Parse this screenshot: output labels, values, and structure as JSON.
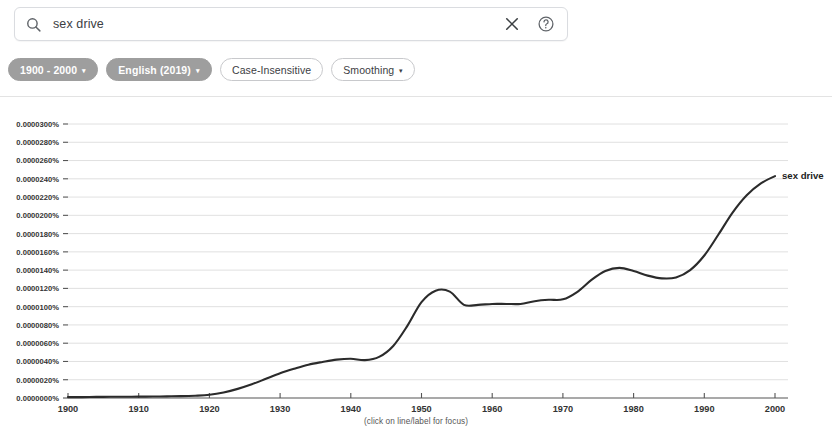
{
  "search": {
    "value": "sex drive",
    "placeholder": "Search in Google Books Ngram Viewer",
    "search_icon": "search-icon",
    "clear_icon": "close-icon",
    "help_icon": "help-circle-icon"
  },
  "chips": [
    {
      "label": "1900 - 2000",
      "style": "filled",
      "caret": "▾",
      "has_caret": true
    },
    {
      "label": "English (2019)",
      "style": "filled",
      "caret": "▾",
      "has_caret": true
    },
    {
      "label": "Case-Insensitive",
      "style": "outlined",
      "caret": "",
      "has_caret": false
    },
    {
      "label": "Smoothing",
      "style": "outlined",
      "caret": "▾",
      "has_caret": true
    }
  ],
  "footer": {
    "note": "(click on line/label for focus)"
  },
  "colors": {
    "line": "#2b2b2b",
    "grid": "#d8d8d8",
    "axis": "#555555",
    "chip_filled_bg": "#9e9e9e",
    "chip_outline": "#c8c9cc"
  },
  "chart_data": {
    "type": "line",
    "title": "",
    "xlabel": "",
    "ylabel": "",
    "xlim": [
      1900,
      2000
    ],
    "ylim": [
      0.0,
      3e-05
    ],
    "grid": true,
    "legend_position": "right-inline",
    "ytick_labels": [
      "0.0000300%",
      "0.0000280%",
      "0.0000260%",
      "0.0000240%",
      "0.0000220%",
      "0.0000200%",
      "0.0000180%",
      "0.0000160%",
      "0.0000140%",
      "0.0000120%",
      "0.0000100%",
      "0.0000080%",
      "0.0000060%",
      "0.0000040%",
      "0.0000020%",
      "0.0000000%"
    ],
    "ytick_values": [
      3e-05,
      2.8e-05,
      2.6e-05,
      2.4e-05,
      2.2e-05,
      2e-05,
      1.8e-05,
      1.6e-05,
      1.4e-05,
      1.2e-05,
      1e-05,
      8e-06,
      6e-06,
      4e-06,
      2e-06,
      0.0
    ],
    "xtick_labels": [
      "1900",
      "1910",
      "1920",
      "1930",
      "1940",
      "1950",
      "1960",
      "1970",
      "1980",
      "1990",
      "2000"
    ],
    "xtick_values": [
      1900,
      1910,
      1920,
      1930,
      1940,
      1950,
      1960,
      1970,
      1980,
      1990,
      2000
    ],
    "series": [
      {
        "name": "sex drive",
        "color": "#2b2b2b",
        "x": [
          1900,
          1902,
          1904,
          1906,
          1908,
          1910,
          1912,
          1914,
          1916,
          1918,
          1920,
          1922,
          1924,
          1926,
          1928,
          1930,
          1932,
          1934,
          1936,
          1938,
          1940,
          1942,
          1944,
          1946,
          1948,
          1950,
          1952,
          1954,
          1956,
          1958,
          1960,
          1962,
          1964,
          1966,
          1968,
          1970,
          1972,
          1974,
          1976,
          1978,
          1980,
          1982,
          1984,
          1986,
          1988,
          1990,
          1992,
          1994,
          1996,
          1998,
          2000
        ],
        "values": [
          1e-07,
          1e-07,
          1.2e-07,
          1.3e-07,
          1.4e-07,
          1.5e-07,
          1.6e-07,
          1.8e-07,
          2e-07,
          2.5e-07,
          3.5e-07,
          6e-07,
          1e-06,
          1.5e-06,
          2.1e-06,
          2.7e-06,
          3.2e-06,
          3.65e-06,
          3.95e-06,
          4.2e-06,
          4.3e-06,
          4.15e-06,
          4.5e-06,
          5.7e-06,
          7.9e-06,
          1.05e-05,
          1.175e-05,
          1.165e-05,
          1.02e-05,
          1.02e-05,
          1.03e-05,
          1.03e-05,
          1.03e-05,
          1.06e-05,
          1.075e-05,
          1.08e-05,
          1.16e-05,
          1.29e-05,
          1.39e-05,
          1.425e-05,
          1.39e-05,
          1.34e-05,
          1.31e-05,
          1.32e-05,
          1.4e-05,
          1.56e-05,
          1.79e-05,
          2.03e-05,
          2.22e-05,
          2.35e-05,
          2.43e-05
        ]
      }
    ]
  }
}
